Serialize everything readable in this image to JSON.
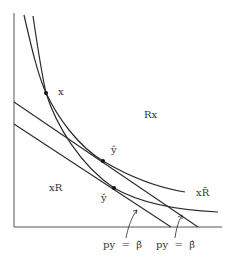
{
  "figure": {
    "type": "diagram",
    "labels": {
      "point_x": "x",
      "region_upper": "Rx",
      "point_y_hat": "ŷ",
      "point_y_check": "y̌",
      "region_lower": "xR",
      "curve_label": "xR̄",
      "budget_lower": "py  =  β̌",
      "budget_upper": "py  =  β̂"
    },
    "points": [
      {
        "name": "x",
        "px": [
          46,
          93
        ]
      },
      {
        "name": "y_hat",
        "px": [
          103,
          161
        ]
      },
      {
        "name": "y_check",
        "px": [
          114,
          188
        ]
      }
    ],
    "colors": {
      "ink": "#2a2a2a",
      "background": "#ffffff"
    }
  }
}
